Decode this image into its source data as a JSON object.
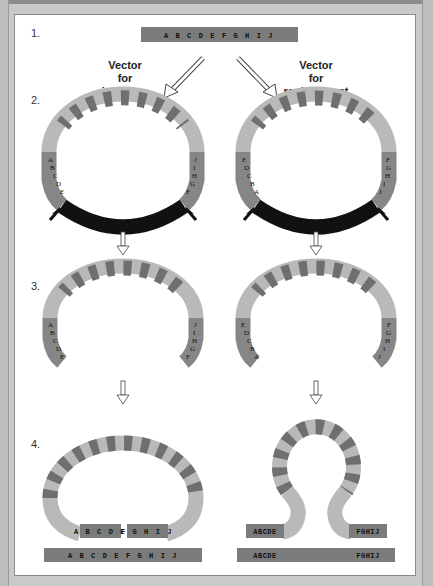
{
  "figure": {
    "steps": [
      "1.",
      "2.",
      "3.",
      "4."
    ],
    "target_gene": "A B C D E F G H I J",
    "vectors": {
      "insertion": {
        "title_lines": [
          "Vector",
          "for",
          "insertion"
        ]
      },
      "replacement": {
        "title_lines": [
          "Vector",
          "for",
          "replacement"
        ]
      }
    },
    "segments": {
      "insertion_left": [
        "A",
        "B",
        "C",
        "D",
        "E"
      ],
      "insertion_right": [
        "J",
        "I",
        "H",
        "G",
        "F"
      ],
      "replacement_left": [
        "E",
        "D",
        "C",
        "B",
        "A"
      ],
      "replacement_right": [
        "F",
        "G",
        "H",
        "I",
        "J"
      ]
    },
    "step4": {
      "insertion": {
        "box_left": "A B C D E",
        "box_right": "F G H I J",
        "chromosome": "A B C D E F G H I J"
      },
      "replacement": {
        "box_left": "ABCDE",
        "box_right": "FGHIJ",
        "chromosome_left": "ABCDE",
        "chromosome_right": "FGHIJ"
      }
    },
    "colors": {
      "stripe_light": "#b9b9b9",
      "stripe_dark": "#6f6f6f",
      "homology_gray": "#868686",
      "cut_black": "#111111",
      "bar_gray": "#7b7b7b"
    }
  }
}
